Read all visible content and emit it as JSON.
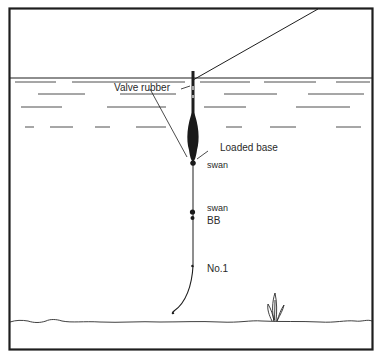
{
  "diagram": {
    "type": "float-fishing-rig",
    "colors": {
      "ink": "#1e1e1e",
      "background": "#ffffff"
    },
    "labels": {
      "valve_rubber": "Valve rubber",
      "loaded_base": "Loaded base",
      "shot_1": "swan",
      "shot_2": "swan",
      "shot_3": "BB",
      "shot_4": "No.1"
    },
    "elements": [
      "frame",
      "fishing-line",
      "water-surface",
      "water-ripples",
      "float",
      "valve-rubber",
      "loaded-base",
      "split-shot-swan-upper",
      "split-shot-swan-lower",
      "split-shot-bb",
      "split-shot-no1",
      "hook",
      "river-bed",
      "weed"
    ]
  }
}
